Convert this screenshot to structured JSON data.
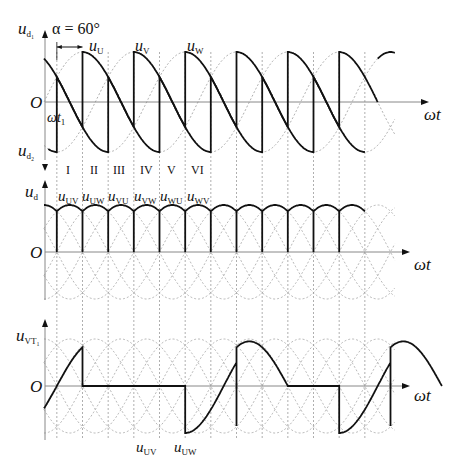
{
  "diagram": {
    "alpha_label": "α = 60°",
    "axis_label_wt": "ωt",
    "origin_label": "O",
    "wt1_label": "ωt",
    "wt1_sub": "1",
    "colors": {
      "trace": "#111111",
      "dashed": "#9a9a9a",
      "axis": "#888888"
    },
    "panels": [
      {
        "id": "top",
        "ylabel_top": "u",
        "ylabel_top_sub": "d₁",
        "ylabel_bottom": "u",
        "ylabel_bottom_sub": "d₂",
        "phase_labels": [
          {
            "text": "u",
            "sub": "U"
          },
          {
            "text": "u",
            "sub": "V"
          },
          {
            "text": "u",
            "sub": "W"
          }
        ]
      },
      {
        "id": "middle",
        "ylabel": "u",
        "ylabel_sub": "d",
        "intervals": [
          "I",
          "II",
          "III",
          "IV",
          "V",
          "VI"
        ],
        "line_labels": [
          {
            "text": "u",
            "sub": "UV"
          },
          {
            "text": "u",
            "sub": "UW"
          },
          {
            "text": "u",
            "sub": "VU"
          },
          {
            "text": "u",
            "sub": "VW"
          },
          {
            "text": "u",
            "sub": "WU"
          },
          {
            "text": "u",
            "sub": "WV"
          }
        ]
      },
      {
        "id": "bottom",
        "ylabel": "u",
        "ylabel_sub": "VT₁",
        "bottom_labels": [
          {
            "text": "u",
            "sub": "UV"
          },
          {
            "text": "u",
            "sub": "UW"
          }
        ]
      }
    ],
    "geometry": {
      "x0_deg0": 44,
      "px_per_deg": 0.4278,
      "alpha_deg": 60,
      "top_origin_y": 102,
      "top_amp": 50,
      "mid_origin_y": 252,
      "mid_amp": 47,
      "bot_origin_y": 386,
      "bot_amp": 47
    }
  }
}
